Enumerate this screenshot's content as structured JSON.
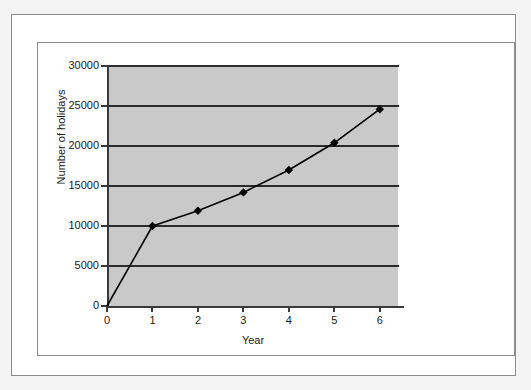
{
  "chart_data": {
    "type": "line",
    "title": "",
    "subtitle": "",
    "xlabel": "Year",
    "ylabel": "Number of holidays",
    "xlim": [
      0,
      6.4
    ],
    "ylim": [
      0,
      30000
    ],
    "x_ticks": [
      "0",
      "1",
      "2",
      "3",
      "4",
      "5",
      "6"
    ],
    "x_tick_values": [
      0,
      1,
      2,
      3,
      4,
      5,
      6
    ],
    "y_ticks": [
      "0",
      "5000",
      "10000",
      "15000",
      "20000",
      "25000",
      "30000"
    ],
    "y_tick_values": [
      0,
      5000,
      10000,
      15000,
      20000,
      25000,
      30000
    ],
    "grid": "horizontal",
    "legend": "none",
    "plot_background": "#c9c9c9",
    "series": [
      {
        "name": "Number of holidays",
        "marker": "diamond",
        "color": "#000000",
        "x": [
          1,
          2,
          3,
          4,
          5,
          6
        ],
        "values": [
          10000,
          11900,
          14200,
          17000,
          20400,
          24600
        ]
      }
    ],
    "annotations": []
  },
  "colors": {
    "plot_fill": "#c9c9c9",
    "gridline": "#2b2b2b",
    "axis": "#3a3a3a",
    "series": "#000000",
    "frame": "#8c8c90",
    "page": "#f4f4f4",
    "panel": "#ffffff",
    "text": "#1a1a1a"
  }
}
